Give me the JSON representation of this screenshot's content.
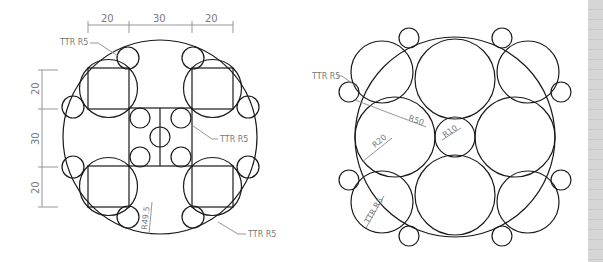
{
  "left_drawing": {
    "top_dimensions": [
      "20",
      "30",
      "20"
    ],
    "side_dimensions": [
      "20",
      "30",
      "20"
    ],
    "labels": {
      "ttr_top_left": "TTR R5",
      "ttr_middle": "TTR R5",
      "ttr_bottom_right": "TTR R5",
      "radius_outer": "R49.5"
    }
  },
  "right_drawing": {
    "labels": {
      "ttr_left": "TTR R5",
      "radius_outer": "R50",
      "radius_large": "R20",
      "radius_center": "R10",
      "ttr_lower": "TTR R5"
    }
  },
  "colors": {
    "geometry": "#1a1a1a",
    "dimension": "#8a8a8a",
    "scrollbar": "#d8d8d8"
  }
}
